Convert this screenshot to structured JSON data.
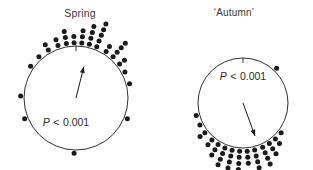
{
  "figure": {
    "type": "circular-plot-pair",
    "background": "#ffffff",
    "ink_color": "#1a1a1a",
    "text_color": "#333333"
  },
  "panels": [
    {
      "id": "spring",
      "title": "Spring",
      "pvalue_text": "P < 0.001",
      "pvalue_symbol": "P",
      "pvalue_relation": "<",
      "pvalue_number": "0.001",
      "tick_label_top": "0",
      "mean_vector_angle_deg": 14,
      "mean_vector_length": 0.62
    },
    {
      "id": "autumn",
      "title": "‘Autumn’",
      "pvalue_text": "P < 0.001",
      "pvalue_symbol": "P",
      "pvalue_relation": "<",
      "pvalue_number": "0.001",
      "tick_label_top": "0",
      "mean_vector_angle_deg": 160,
      "mean_vector_length": 0.78
    }
  ],
  "chart_data": [
    {
      "type": "scatter",
      "subtype": "circular-dot-histogram",
      "title": "Spring",
      "xlabel": "",
      "ylabel": "",
      "annotations": [
        "P < 0.001"
      ],
      "axis_range_deg": [
        0,
        360
      ],
      "grid": false,
      "legend": "none",
      "circle": {
        "cx": 76,
        "cy": 98,
        "r": 52
      },
      "tick_marks_deg": [
        0
      ],
      "mean_vector": {
        "angle_deg": 14,
        "length_fraction": 0.62
      },
      "bins": [
        {
          "angle_deg": 272,
          "count": 1
        },
        {
          "angle_deg": 305,
          "count": 1
        },
        {
          "angle_deg": 318,
          "count": 1
        },
        {
          "angle_deg": 330,
          "count": 2
        },
        {
          "angle_deg": 341,
          "count": 2
        },
        {
          "angle_deg": 350,
          "count": 3
        },
        {
          "angle_deg": 358,
          "count": 2
        },
        {
          "angle_deg": 6,
          "count": 3
        },
        {
          "angle_deg": 14,
          "count": 4
        },
        {
          "angle_deg": 22,
          "count": 5
        },
        {
          "angle_deg": 33,
          "count": 2
        },
        {
          "angle_deg": 42,
          "count": 4
        },
        {
          "angle_deg": 52,
          "count": 2
        },
        {
          "angle_deg": 62,
          "count": 1
        },
        {
          "angle_deg": 75,
          "count": 1
        },
        {
          "angle_deg": 112,
          "count": 1
        },
        {
          "angle_deg": 182,
          "count": 1
        },
        {
          "angle_deg": 248,
          "count": 1
        }
      ]
    },
    {
      "type": "scatter",
      "subtype": "circular-dot-histogram",
      "title": "‘Autumn’",
      "xlabel": "",
      "ylabel": "",
      "annotations": [
        "P < 0.001"
      ],
      "axis_range_deg": [
        0,
        360
      ],
      "grid": false,
      "legend": "none",
      "circle": {
        "cx": 243,
        "cy": 103,
        "r": 45
      },
      "tick_marks_deg": [
        0
      ],
      "mean_vector": {
        "angle_deg": 160,
        "length_fraction": 0.78
      },
      "bins": [
        {
          "angle_deg": 44,
          "count": 1
        },
        {
          "angle_deg": 128,
          "count": 1
        },
        {
          "angle_deg": 138,
          "count": 2
        },
        {
          "angle_deg": 147,
          "count": 3
        },
        {
          "angle_deg": 156,
          "count": 4
        },
        {
          "angle_deg": 166,
          "count": 4
        },
        {
          "angle_deg": 175,
          "count": 3
        },
        {
          "angle_deg": 184,
          "count": 4
        },
        {
          "angle_deg": 193,
          "count": 5
        },
        {
          "angle_deg": 202,
          "count": 4
        },
        {
          "angle_deg": 211,
          "count": 3
        },
        {
          "angle_deg": 220,
          "count": 2
        },
        {
          "angle_deg": 232,
          "count": 2
        },
        {
          "angle_deg": 243,
          "count": 1
        },
        {
          "angle_deg": 255,
          "count": 1
        }
      ]
    }
  ]
}
